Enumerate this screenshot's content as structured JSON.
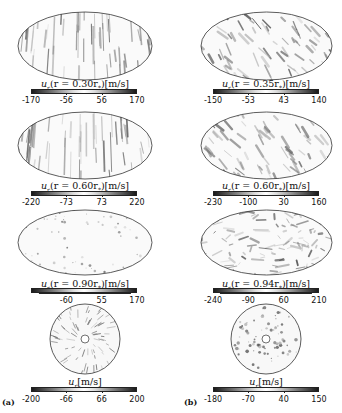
{
  "figure": {
    "subfigure_labels": [
      "(a)",
      "(b)"
    ],
    "colormap": {
      "min_color": "#1a1a1a",
      "mid_color": "#ffffff",
      "max_color": "#1a1a1a"
    },
    "columns": [
      {
        "id": "a",
        "panels": [
          {
            "projection": "mollweide",
            "quantity": "u_r",
            "radius": "0.30r_*",
            "label_var": "u",
            "label_sub": "r",
            "label_expr": "(r = 0.30r",
            "label_tail": ")[m/s]",
            "ticks": [
              "-170",
              "-56",
              "56",
              "170"
            ]
          },
          {
            "projection": "mollweide",
            "quantity": "u_r",
            "radius": "0.60r_*",
            "label_var": "u",
            "label_sub": "r",
            "label_expr": "(r = 0.60r",
            "label_tail": ")[m/s]",
            "ticks": [
              "-220",
              "-73",
              "73",
              "220"
            ]
          },
          {
            "projection": "mollweide",
            "quantity": "u_r",
            "radius": "0.90r_*",
            "label_var": "u",
            "label_sub": "r",
            "label_expr": "(r = 0.90r",
            "label_tail": ")[m/s]",
            "ticks": [
              "",
              "-60",
              "55",
              "170"
            ]
          },
          {
            "projection": "equatorial-disc",
            "quantity": "u_r",
            "label_var": "u",
            "label_sub": "r",
            "label_expr": "",
            "label_tail": "[m/s]",
            "ticks": [
              "-200",
              "-66",
              "66",
              "200"
            ]
          }
        ]
      },
      {
        "id": "b",
        "panels": [
          {
            "projection": "mollweide",
            "quantity": "u_r",
            "radius": "0.35r_*",
            "label_var": "u",
            "label_sub": "r",
            "label_expr": "(r = 0.35r",
            "label_tail": ")[m/s]",
            "ticks": [
              "-150",
              "-53",
              "43",
              "140"
            ]
          },
          {
            "projection": "mollweide",
            "quantity": "u_r",
            "radius": "0.60r_*",
            "label_var": "u",
            "label_sub": "r",
            "label_expr": "(r = 0.60r",
            "label_tail": ")[m/s]",
            "ticks": [
              "-230",
              "-100",
              "30",
              "160"
            ]
          },
          {
            "projection": "mollweide",
            "quantity": "u_r",
            "radius": "0.94r_*",
            "label_var": "u",
            "label_sub": "r",
            "label_expr": "(r = 0.94r",
            "label_tail": ")[m/s]",
            "ticks": [
              "-240",
              "-90",
              "60",
              "210"
            ]
          },
          {
            "projection": "equatorial-disc",
            "quantity": "u_r",
            "label_var": "u",
            "label_sub": "r",
            "label_expr": "",
            "label_tail": "[m/s]",
            "ticks": [
              "-180",
              "-70",
              "40",
              "150"
            ]
          }
        ]
      }
    ],
    "star_sub": "*"
  }
}
